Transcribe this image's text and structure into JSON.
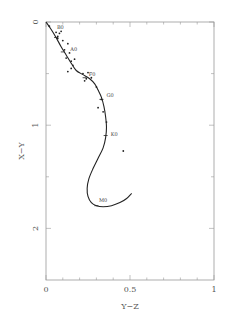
{
  "chart_data": {
    "type": "line",
    "title": "",
    "xlabel": "Y−Z",
    "ylabel": "X−Y",
    "xlim": [
      0,
      1
    ],
    "ylim": [
      0,
      2.5
    ],
    "y_inverted": true,
    "grid": false,
    "x_ticks": [
      {
        "value": 0,
        "label": "0"
      },
      {
        "value": 0.5,
        "label": "0.5"
      },
      {
        "value": 1,
        "label": "1"
      }
    ],
    "x_minor_ticks": [
      0.1,
      0.2,
      0.3,
      0.4,
      0.6,
      0.7,
      0.8,
      0.9
    ],
    "y_ticks": [
      {
        "value": 0,
        "label": "0"
      },
      {
        "value": 1,
        "label": "1"
      },
      {
        "value": 2,
        "label": "2"
      }
    ],
    "y_minor_ticks": [
      0.5,
      1.5
    ],
    "series": [
      {
        "name": "main-sequence-locus",
        "kind": "line",
        "x": [
          0.0,
          0.03,
          0.06,
          0.09,
          0.12,
          0.15,
          0.18,
          0.22,
          0.26,
          0.29,
          0.31,
          0.33,
          0.345,
          0.355,
          0.36,
          0.355,
          0.34,
          0.31,
          0.28,
          0.255,
          0.245,
          0.25,
          0.27,
          0.3,
          0.34,
          0.39,
          0.44,
          0.48,
          0.51
        ],
        "y": [
          0.0,
          0.07,
          0.15,
          0.24,
          0.32,
          0.4,
          0.47,
          0.51,
          0.55,
          0.6,
          0.66,
          0.73,
          0.82,
          0.92,
          1.02,
          1.12,
          1.22,
          1.32,
          1.42,
          1.52,
          1.61,
          1.69,
          1.75,
          1.78,
          1.79,
          1.78,
          1.75,
          1.71,
          1.66
        ]
      },
      {
        "name": "stars",
        "kind": "scatter",
        "x": [
          0.02,
          0.06,
          0.07,
          0.08,
          0.09,
          0.07,
          0.1,
          0.11,
          0.13,
          0.14,
          0.12,
          0.15,
          0.17,
          0.16,
          0.15,
          0.13,
          0.22,
          0.24,
          0.25,
          0.27,
          0.23,
          0.3,
          0.33,
          0.31,
          0.34,
          0.36,
          0.46
        ],
        "y": [
          0.04,
          0.1,
          0.14,
          0.11,
          0.09,
          0.16,
          0.18,
          0.27,
          0.21,
          0.3,
          0.35,
          0.38,
          0.36,
          0.42,
          0.45,
          0.48,
          0.5,
          0.55,
          0.49,
          0.54,
          0.57,
          0.63,
          0.75,
          0.83,
          0.87,
          0.97,
          1.25
        ]
      }
    ],
    "annotations": [
      {
        "text": "B0",
        "x": 0.065,
        "y": 0.05
      },
      {
        "text": "A0",
        "x": 0.145,
        "y": 0.26
      },
      {
        "text": "F0",
        "x": 0.255,
        "y": 0.5
      },
      {
        "text": "G0",
        "x": 0.36,
        "y": 0.71
      },
      {
        "text": "K0",
        "x": 0.385,
        "y": 1.09
      },
      {
        "text": "M0",
        "x": 0.315,
        "y": 1.72
      }
    ],
    "spectral_marks": [
      {
        "label": "B0",
        "x": 0.06,
        "y": 0.15
      },
      {
        "label": "A0",
        "x": 0.1,
        "y": 0.29
      },
      {
        "label": "F0",
        "x": 0.23,
        "y": 0.54
      },
      {
        "label": "G0",
        "x": 0.33,
        "y": 0.75
      },
      {
        "label": "K0",
        "x": 0.355,
        "y": 1.1
      },
      {
        "label": "M0",
        "x": 0.3,
        "y": 1.78
      }
    ]
  }
}
